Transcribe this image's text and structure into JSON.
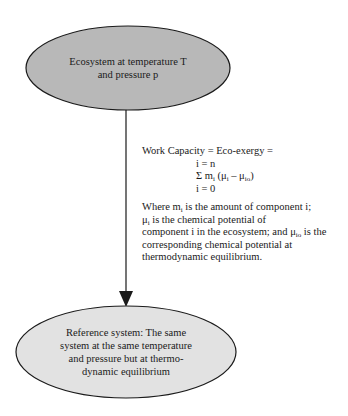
{
  "diagram": {
    "top_node": {
      "label_line1": "Ecosystem at temperature T",
      "label_line2": "and pressure p",
      "fill": "#b8b8b8"
    },
    "bottom_node": {
      "label_line1": "Reference system: The same",
      "label_line2": "system at the same temperature",
      "label_line3": "and pressure but at thermo-",
      "label_line4": "dynamic equilibrium",
      "fill": "#e2e2e2"
    },
    "edge": {
      "from": "top_node",
      "to": "bottom_node",
      "type": "arrow"
    },
    "annotation": {
      "equation_title": "Work Capacity = Eco-exergy =",
      "upper_limit": "i = n",
      "sum_symbol": "Σ",
      "sum_term_m": "m",
      "sum_term_m_sub": "i",
      "sum_term_open": " (μ",
      "sum_term_mu_sub": "i",
      "sum_term_minus": " – μ",
      "sum_term_mu0_sub": "io",
      "sum_term_close": ")",
      "lower_limit": "i = 0",
      "desc_1a": "Where m",
      "desc_1a_sub": "i",
      "desc_1b": " is the amount of component i;",
      "desc_2a": "μ",
      "desc_2a_sub": "i",
      "desc_2b": " is the chemical potential of",
      "desc_3a": "component i in the ecosystem; and μ",
      "desc_3a_sub": "io",
      "desc_3b": " is the",
      "desc_4": "corresponding chemical potential at",
      "desc_5": "thermodynamic equilibrium."
    }
  }
}
